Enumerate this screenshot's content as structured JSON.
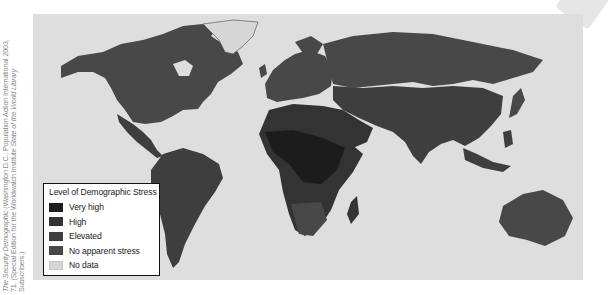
{
  "source_credit": {
    "line1_italic": "The Security Demographic",
    "line1_rest": " (Washington D.C.: Population Action International 2003,",
    "line2_a": "71. (Special Edition for the Worldwatch Institute ",
    "line2_italic": "State of the World Library",
    "line3": "Subscribers.)"
  },
  "map": {
    "ocean_color": "#dedede",
    "legend": {
      "title": "Level of Demographic Stress",
      "items": [
        {
          "label": "Very high",
          "color": "#1c1c1c"
        },
        {
          "label": "High",
          "color": "#333333"
        },
        {
          "label": "Elevated",
          "color": "#3e3e3e"
        },
        {
          "label": "No apparent stress",
          "color": "#484848"
        },
        {
          "label": "No data",
          "color": "#d6d6d6"
        }
      ]
    }
  }
}
